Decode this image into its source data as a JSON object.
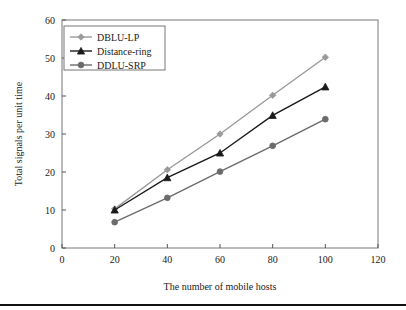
{
  "chart_data": {
    "type": "line",
    "title": "",
    "xlabel": "The number of mobile hosts",
    "ylabel": "Total signals per unit time",
    "x": [
      20,
      40,
      60,
      80,
      100
    ],
    "xlim": [
      0,
      120
    ],
    "ylim": [
      0,
      60
    ],
    "xticks": [
      "0",
      "20",
      "40",
      "60",
      "80",
      "100",
      "120"
    ],
    "yticks": [
      "0",
      "10",
      "20",
      "30",
      "40",
      "50",
      "60"
    ],
    "xtick_values": [
      0,
      20,
      40,
      60,
      80,
      100,
      120
    ],
    "ytick_values": [
      0,
      10,
      20,
      30,
      40,
      50,
      60
    ],
    "grid": false,
    "legend_position": "top-left",
    "series": [
      {
        "name": "DBLU-LP",
        "values": [
          10.3,
          20.6,
          30.0,
          40.2,
          50.2
        ],
        "color": "#9a9a9a",
        "marker": "diamond"
      },
      {
        "name": "Distance-ring",
        "values": [
          10.0,
          18.5,
          25.0,
          34.9,
          42.4
        ],
        "color": "#1a1a1a",
        "marker": "triangle"
      },
      {
        "name": "DDLU-SRP",
        "values": [
          6.8,
          13.2,
          20.1,
          26.9,
          33.9
        ],
        "color": "#6b6b6b",
        "marker": "circle"
      }
    ]
  },
  "legend": {
    "items": [
      {
        "label": "DBLU-LP"
      },
      {
        "label": "Distance-ring"
      },
      {
        "label": "DDLU-SRP"
      }
    ]
  }
}
